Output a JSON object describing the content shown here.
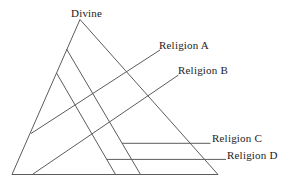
{
  "diagram": {
    "apex_label": "Divine",
    "religion_labels": {
      "a": "Religion A",
      "b": "Religion B",
      "c": "Religion C",
      "d": "Religion D"
    },
    "colors": {
      "line": "#5c5c5c",
      "text": "#1c1c1c",
      "background": "#ffffff"
    }
  }
}
